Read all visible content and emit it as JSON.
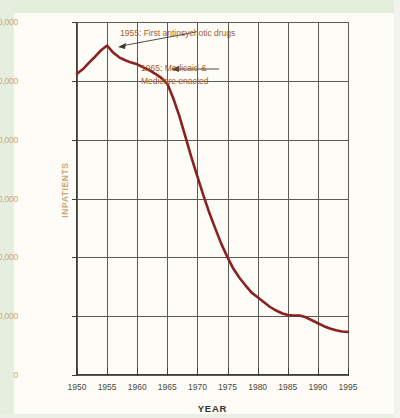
{
  "chart_data": {
    "type": "line",
    "title": "",
    "xlabel": "YEAR",
    "ylabel": "INPATIENTS",
    "xlim": [
      1950,
      1995
    ],
    "ylim": [
      0,
      600000
    ],
    "grid": true,
    "legend": "none",
    "line_color": "#8B2222",
    "x": [
      1950,
      1951,
      1952,
      1953,
      1954,
      1955,
      1956,
      1957,
      1958,
      1959,
      1960,
      1961,
      1962,
      1963,
      1964,
      1965,
      1966,
      1967,
      1968,
      1969,
      1970,
      1971,
      1972,
      1973,
      1974,
      1975,
      1976,
      1977,
      1978,
      1979,
      1980,
      1981,
      1982,
      1983,
      1984,
      1985,
      1986,
      1987,
      1988,
      1989,
      1990,
      1991,
      1992,
      1993,
      1994,
      1995
    ],
    "values": [
      512000,
      520000,
      531000,
      541000,
      552000,
      560000,
      548000,
      540000,
      535000,
      531000,
      528000,
      523000,
      518000,
      512000,
      505000,
      495000,
      470000,
      440000,
      405000,
      370000,
      337000,
      305000,
      275000,
      248000,
      222000,
      200000,
      180000,
      165000,
      152000,
      140000,
      132000,
      124000,
      116000,
      110000,
      105000,
      102000,
      101000,
      101000,
      98000,
      93000,
      88000,
      83000,
      79000,
      76000,
      74000,
      73000
    ],
    "y_ticks": [
      "0",
      "100,000",
      "200,000",
      "300,000",
      "400,000",
      "500,000",
      "600,000"
    ],
    "y_tick_values": [
      0,
      100000,
      200000,
      300000,
      400000,
      500000,
      600000
    ],
    "x_ticks": [
      "1950",
      "1955",
      "1960",
      "1965",
      "1970",
      "1975",
      "1980",
      "1985",
      "1990",
      "1995"
    ],
    "x_tick_values": [
      1950,
      1955,
      1960,
      1965,
      1970,
      1975,
      1980,
      1985,
      1990,
      1995
    ],
    "annotations": [
      {
        "text": "1955: First antipsychotic drugs",
        "target_x": 1955,
        "target_y": 560000
      },
      {
        "text_line1": "1965: Medicaid &",
        "text_line2": "Medicare enacted",
        "target_x": 1965,
        "target_y": 495000
      }
    ]
  },
  "axis": {
    "y_label": "INPATIENTS",
    "x_label": "YEAR",
    "y_ticks": [
      "600,000",
      "500,000",
      "400,000",
      "300,000",
      "200,000",
      "100,000",
      "0"
    ],
    "x_ticks": [
      "1950",
      "1955",
      "1960",
      "1965",
      "1970",
      "1975",
      "1980",
      "1985",
      "1990",
      "1995"
    ]
  },
  "annotations": {
    "first": "1955: First antipsychotic drugs",
    "second_line1": "1965: Medicaid &",
    "second_line2": "Medicare enacted"
  },
  "colors": {
    "line": "#8B2222",
    "annotation_text": "#a6602b",
    "tick_label": "#c9a878",
    "grid": "#5b5b56",
    "axis": "#3d3d39"
  }
}
